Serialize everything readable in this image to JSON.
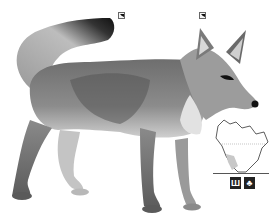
{
  "illustration": {
    "subject": "fox",
    "style": "grayscale pencil illustration"
  },
  "markers": [
    {
      "id": "tail-marker",
      "x": 118,
      "y": 12
    },
    {
      "id": "ear-marker",
      "x": 199,
      "y": 12
    }
  ],
  "range_map": {
    "region": "North America",
    "highlight_color": "#c8c8c8"
  },
  "habitat_icons": [
    {
      "name": "grassland-icon",
      "glyph": "Ш"
    },
    {
      "name": "desert-icon",
      "glyph": "♣"
    }
  ],
  "colors": {
    "background": "#ffffff",
    "fur_dark": "#3a3a3a",
    "fur_mid": "#8a8a8a",
    "fur_light": "#d0d0d0"
  }
}
